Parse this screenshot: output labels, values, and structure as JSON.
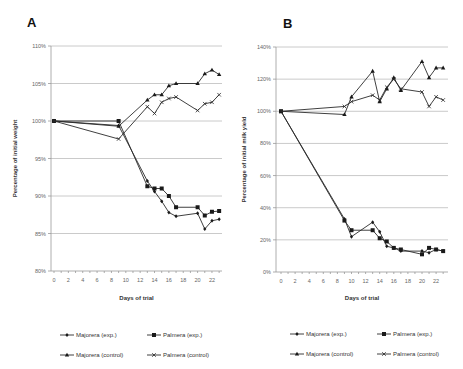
{
  "chart_data": [
    {
      "panel": "A",
      "type": "line",
      "title": "A",
      "xlabel": "Days of trial",
      "ylabel": "Percentage of initial weight",
      "xticks": [
        0,
        2,
        4,
        6,
        8,
        10,
        12,
        14,
        16,
        18,
        20,
        22
      ],
      "yticks": [
        "80%",
        "85%",
        "90%",
        "95%",
        "100%",
        "105%",
        "110%"
      ],
      "ylim": [
        80,
        110
      ],
      "xlim": [
        0,
        23.5
      ],
      "grid": true,
      "legend_position": "bottom",
      "series": [
        {
          "name": "Majorera (exp.)",
          "marker": "diamond",
          "x": [
            0,
            9,
            13,
            14,
            15,
            16,
            17,
            20,
            21,
            22,
            23
          ],
          "y": [
            100,
            99.4,
            92.0,
            90.6,
            89.3,
            87.8,
            87.3,
            87.7,
            85.6,
            86.7,
            86.9
          ]
        },
        {
          "name": "Palmera (exp.)",
          "marker": "square",
          "x": [
            0,
            9,
            13,
            14,
            15,
            16,
            17,
            20,
            21,
            22,
            23
          ],
          "y": [
            100,
            100,
            91.3,
            91.0,
            91.0,
            90.0,
            88.5,
            88.5,
            87.4,
            87.9,
            88.0
          ]
        },
        {
          "name": "Majorera (control)",
          "marker": "triangle",
          "x": [
            0,
            9,
            13,
            14,
            15,
            16,
            17,
            20,
            21,
            22,
            23
          ],
          "y": [
            100,
            99.3,
            102.8,
            103.5,
            103.5,
            104.7,
            105.0,
            105.0,
            106.3,
            106.8,
            106.2
          ]
        },
        {
          "name": "Palmera (control)",
          "marker": "x",
          "x": [
            0,
            9,
            13,
            14,
            15,
            16,
            17,
            20,
            21,
            22,
            23
          ],
          "y": [
            100,
            97.6,
            101.9,
            101.0,
            102.5,
            103.0,
            103.2,
            101.4,
            102.3,
            102.5,
            103.5
          ]
        }
      ]
    },
    {
      "panel": "B",
      "type": "line",
      "title": "B",
      "xlabel": "Days of trial",
      "ylabel": "Percentage of initial milk yield",
      "xticks": [
        0,
        2,
        4,
        6,
        8,
        10,
        12,
        14,
        16,
        18,
        20,
        22
      ],
      "yticks": [
        "0%",
        "20%",
        "40%",
        "60%",
        "80%",
        "100%",
        "120%",
        "140%"
      ],
      "ylim": [
        0,
        140
      ],
      "xlim": [
        0,
        23.5
      ],
      "grid": true,
      "legend_position": "bottom",
      "series": [
        {
          "name": "Majorera (exp.)",
          "marker": "diamond",
          "x": [
            0,
            9,
            10,
            13,
            14,
            15,
            16,
            17,
            20,
            21,
            22,
            23
          ],
          "y": [
            100,
            33,
            22,
            31,
            25,
            16,
            15,
            13,
            13,
            12,
            14,
            13
          ]
        },
        {
          "name": "Palmera (exp.)",
          "marker": "square",
          "x": [
            0,
            9,
            10,
            13,
            14,
            15,
            16,
            17,
            20,
            21,
            22,
            23
          ],
          "y": [
            100,
            32,
            26,
            26,
            21,
            19,
            15,
            14,
            11,
            15,
            14,
            13
          ]
        },
        {
          "name": "Majorera (control)",
          "marker": "triangle",
          "x": [
            0,
            9,
            10,
            13,
            14,
            15,
            16,
            17,
            20,
            21,
            22,
            23
          ],
          "y": [
            100,
            98,
            109,
            125,
            106,
            114,
            121,
            113,
            131,
            121,
            127,
            127
          ]
        },
        {
          "name": "Palmera (control)",
          "marker": "x",
          "x": [
            0,
            9,
            10,
            13,
            14,
            15,
            16,
            17,
            20,
            21,
            22,
            23
          ],
          "y": [
            100,
            103,
            106,
            110,
            107,
            115,
            120,
            114,
            112,
            103,
            109,
            107
          ]
        }
      ]
    }
  ],
  "legend": {
    "items": [
      {
        "label": "Majorera (exp.)",
        "marker": "diamond"
      },
      {
        "label": "Palmera (exp.)",
        "marker": "square"
      },
      {
        "label": "Majorera (control)",
        "marker": "triangle"
      },
      {
        "label": "Palmera (control)",
        "marker": "x"
      }
    ]
  }
}
